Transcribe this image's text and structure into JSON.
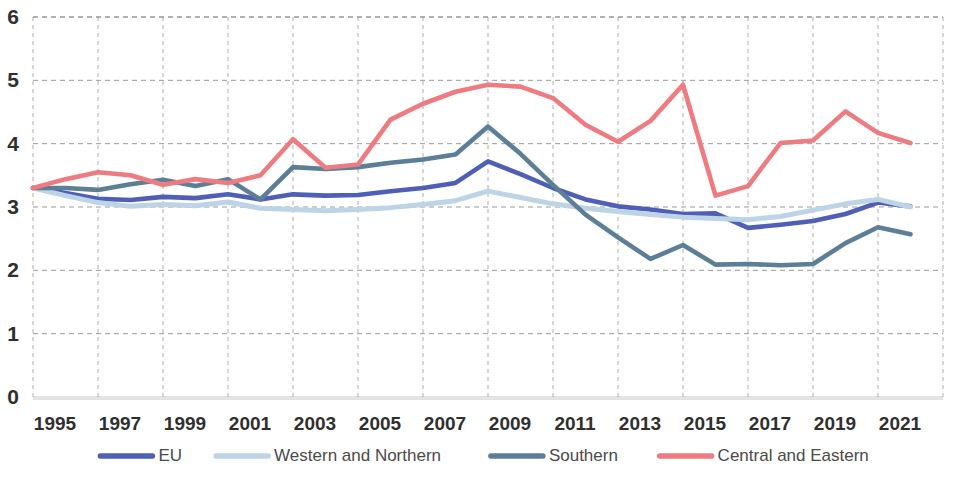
{
  "chart_data": {
    "type": "line",
    "title": "",
    "subtitle": "",
    "xlabel": "",
    "ylabel": "",
    "xlim": [
      1995,
      2023
    ],
    "ylim": [
      0,
      6
    ],
    "grid": true,
    "legend_position": "bottom",
    "x": [
      1995,
      1996,
      1997,
      1998,
      1999,
      2000,
      2001,
      2002,
      2003,
      2004,
      2005,
      2006,
      2007,
      2008,
      2009,
      2010,
      2011,
      2012,
      2013,
      2014,
      2015,
      2016,
      2017,
      2018,
      2019,
      2020,
      2021,
      2022
    ],
    "xticks": [
      "1995",
      "1997",
      "1999",
      "2001",
      "2003",
      "2005",
      "2007",
      "2009",
      "2011",
      "2013",
      "2015",
      "2017",
      "2019",
      "2021"
    ],
    "yticks": [
      "0",
      "1",
      "2",
      "3",
      "4",
      "5",
      "6"
    ],
    "series": [
      {
        "name": "EU",
        "color": "#4f5fb5",
        "values": [
          3.3,
          3.22,
          3.13,
          3.11,
          3.16,
          3.14,
          3.2,
          3.12,
          3.2,
          3.18,
          3.19,
          3.25,
          3.3,
          3.38,
          3.72,
          3.52,
          3.3,
          3.12,
          3.01,
          2.96,
          2.89,
          2.9,
          2.67,
          2.72,
          2.78,
          2.89,
          3.07,
          3.01
        ]
      },
      {
        "name": "Western and Northern",
        "color": "#bdd3e6",
        "values": [
          3.3,
          3.18,
          3.07,
          3.01,
          3.04,
          3.02,
          3.08,
          2.98,
          2.96,
          2.94,
          2.96,
          2.99,
          3.04,
          3.1,
          3.25,
          3.15,
          3.05,
          2.98,
          2.93,
          2.88,
          2.84,
          2.82,
          2.8,
          2.85,
          2.95,
          3.05,
          3.12,
          3.0
        ]
      },
      {
        "name": "Southern",
        "color": "#5c7f97",
        "values": [
          3.3,
          3.3,
          3.27,
          3.36,
          3.43,
          3.33,
          3.44,
          3.12,
          3.63,
          3.6,
          3.63,
          3.7,
          3.75,
          3.83,
          4.27,
          3.84,
          3.35,
          2.88,
          2.52,
          2.18,
          2.4,
          2.09,
          2.1,
          2.08,
          2.1,
          2.43,
          2.68,
          2.57
        ]
      },
      {
        "name": "Central and Eastern",
        "color": "#ee7b80",
        "values": [
          3.3,
          3.44,
          3.55,
          3.5,
          3.35,
          3.44,
          3.38,
          3.5,
          4.07,
          3.62,
          3.67,
          4.38,
          4.63,
          4.82,
          4.93,
          4.9,
          4.72,
          4.3,
          4.03,
          4.36,
          4.93,
          3.18,
          3.33,
          4.01,
          4.05,
          4.51,
          4.17,
          4.01
        ]
      }
    ]
  },
  "legend": {
    "items": [
      {
        "label": "EU",
        "color": "#4f5fb5"
      },
      {
        "label": "Western and Northern",
        "color": "#bdd3e6"
      },
      {
        "label": "Southern",
        "color": "#5c7f97"
      },
      {
        "label": "Central and Eastern",
        "color": "#ee7b80"
      }
    ]
  }
}
